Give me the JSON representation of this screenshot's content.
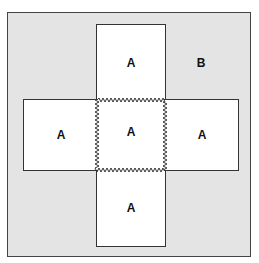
{
  "diagram": {
    "regions": [
      {
        "id": "top",
        "label": "A"
      },
      {
        "id": "left",
        "label": "A"
      },
      {
        "id": "center",
        "label": "A"
      },
      {
        "id": "right",
        "label": "A"
      },
      {
        "id": "bottom",
        "label": "A"
      },
      {
        "id": "background",
        "label": "B"
      }
    ],
    "colors": {
      "background": "#e4e4e4",
      "region": "#ffffff",
      "stroke": "#333333"
    }
  }
}
